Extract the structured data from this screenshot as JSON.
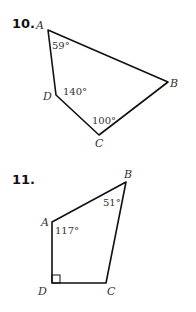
{
  "problems": [
    {
      "number": "10.",
      "vertices": {
        "A": "A",
        "B": "B",
        "C": "C",
        "D": "D"
      },
      "angles": {
        "A": "59°",
        "D": "140°",
        "C": "100°"
      }
    },
    {
      "number": "11.",
      "vertices": {
        "A": "A",
        "B": "B",
        "C": "C",
        "D": "D"
      },
      "angles": {
        "A": "117°",
        "B": "51°",
        "D": "right-angle"
      }
    }
  ]
}
